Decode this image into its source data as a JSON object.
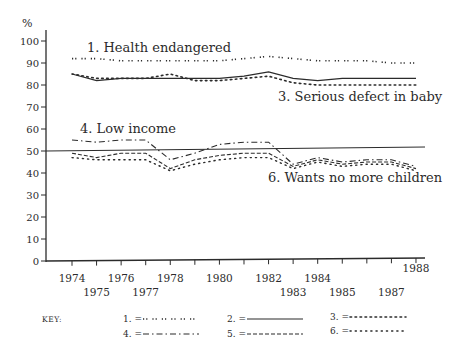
{
  "chart_data": {
    "type": "line",
    "title": "",
    "ylabel": "%",
    "xlabel": "",
    "ylim": [
      0,
      100
    ],
    "yticks": [
      0,
      10,
      20,
      30,
      40,
      50,
      60,
      70,
      80,
      90,
      100
    ],
    "x": [
      1974,
      1975,
      1976,
      1977,
      1978,
      1979,
      1980,
      1981,
      1982,
      1983,
      1984,
      1985,
      1986,
      1987,
      1988
    ],
    "xtick_labels": [
      "1974",
      "1975",
      "1976",
      "1977",
      "1978",
      "",
      "1980",
      "",
      "1982",
      "1983",
      "1984",
      "1985",
      "",
      "1987",
      "1988"
    ],
    "reference_line": {
      "y": 50,
      "style": "solid"
    },
    "series": [
      {
        "id": 1,
        "name": "Health endangered",
        "style": "double-dot",
        "values": [
          92,
          92,
          91,
          91,
          91,
          91,
          91,
          92,
          93,
          92,
          91,
          91,
          91,
          90,
          90
        ]
      },
      {
        "id": 2,
        "name": "",
        "style": "solid",
        "values": [
          85,
          82,
          83,
          83,
          83,
          83,
          83,
          84,
          86,
          83,
          82,
          83,
          83,
          83,
          83
        ]
      },
      {
        "id": 3,
        "name": "Serious defect in baby",
        "style": "circles",
        "values": [
          85,
          83,
          83,
          83,
          85,
          82,
          82,
          83,
          84,
          81,
          80,
          80,
          80,
          80,
          80
        ]
      },
      {
        "id": 4,
        "name": "Low income",
        "style": "dash-dot",
        "values": [
          55,
          54,
          55,
          55,
          46,
          49,
          53,
          54,
          54,
          44,
          47,
          45,
          46,
          46,
          43
        ]
      },
      {
        "id": 5,
        "name": "",
        "style": "tilde",
        "values": [
          49,
          47,
          49,
          49,
          42,
          46,
          48,
          49,
          49,
          43,
          46,
          44,
          45,
          45,
          42
        ]
      },
      {
        "id": 6,
        "name": "Wants no more children",
        "style": "dotted",
        "values": [
          47,
          46,
          46,
          46,
          41,
          44,
          46,
          47,
          47,
          42,
          45,
          43,
          44,
          44,
          41
        ]
      }
    ],
    "annotations": [
      {
        "text": "1. Health endangered",
        "x": 87,
        "y": 52
      },
      {
        "text": "3. Serious defect in baby",
        "x": 278,
        "y": 101
      },
      {
        "text": "4. Low income",
        "x": 80,
        "y": 133
      },
      {
        "text": "6. Wants no more children",
        "x": 268,
        "y": 182
      }
    ],
    "legend": {
      "title": "KEY:",
      "position": "bottom",
      "entries": [
        {
          "label": "1. =",
          "style": "double-dot"
        },
        {
          "label": "2. =",
          "style": "solid"
        },
        {
          "label": "3. =",
          "style": "circles"
        },
        {
          "label": "4. =",
          "style": "dash-dot"
        },
        {
          "label": "5. =",
          "style": "tilde"
        },
        {
          "label": "6. =",
          "style": "dotted"
        }
      ]
    },
    "grid": false
  }
}
